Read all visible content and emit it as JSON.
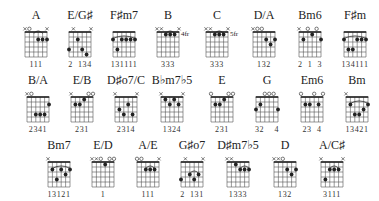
{
  "colors": {
    "ink": "#222222",
    "grid": "#555555",
    "background": "#ffffff"
  },
  "chords": [
    {
      "name": "A",
      "x": 14,
      "y": 8,
      "markers": [
        "x",
        "o",
        "",
        "",
        "",
        "x"
      ],
      "dots": [
        [
          3,
          2
        ],
        [
          4,
          2
        ],
        [
          5,
          2
        ]
      ],
      "barre": {
        "from": 2,
        "to": 4,
        "arc": true
      },
      "fret_label": "",
      "fingering": "111"
    },
    {
      "name": "E/G♯",
      "x": 58,
      "y": 8,
      "markers": [
        "",
        "x",
        "",
        "",
        "",
        "x"
      ],
      "dots": [
        [
          0,
          4
        ],
        [
          2,
          2
        ],
        [
          3,
          4
        ],
        [
          4,
          5
        ]
      ],
      "barre": null,
      "fret_label": "",
      "fingering": "2  134"
    },
    {
      "name": "F♯m7",
      "x": 102,
      "y": 8,
      "markers": [
        "",
        "",
        "",
        "",
        "",
        ""
      ],
      "dots": [
        [
          0,
          2
        ],
        [
          1,
          4
        ],
        [
          2,
          2
        ],
        [
          3,
          2
        ],
        [
          4,
          2
        ],
        [
          5,
          2
        ]
      ],
      "barre": {
        "from": 0,
        "to": 5,
        "arc": true
      },
      "fret_label": "",
      "fingering": "131111"
    },
    {
      "name": "B",
      "x": 146,
      "y": 8,
      "markers": [
        "x",
        "x",
        "",
        "",
        "",
        "x"
      ],
      "dots": [
        [
          2,
          1
        ],
        [
          3,
          1
        ],
        [
          4,
          1
        ]
      ],
      "barre": {
        "from": 2,
        "to": 4,
        "arc": true
      },
      "fret_label": "4fr",
      "fingering": "333"
    },
    {
      "name": "C",
      "x": 195,
      "y": 8,
      "markers": [
        "x",
        "x",
        "",
        "",
        "",
        "x"
      ],
      "dots": [
        [
          2,
          1
        ],
        [
          3,
          1
        ],
        [
          4,
          1
        ]
      ],
      "barre": {
        "from": 2,
        "to": 4,
        "arc": true
      },
      "fret_label": "5fr",
      "fingering": "333"
    },
    {
      "name": "D/A",
      "x": 242,
      "y": 8,
      "markers": [
        "x",
        "o",
        "o",
        "",
        "",
        ""
      ],
      "dots": [
        [
          3,
          2
        ],
        [
          4,
          3
        ],
        [
          5,
          2
        ]
      ],
      "barre": null,
      "fret_label": "",
      "fingering": "132"
    },
    {
      "name": "Bm6",
      "x": 288,
      "y": 8,
      "markers": [
        "x",
        "",
        "o",
        "",
        "o",
        ""
      ],
      "dots": [
        [
          1,
          2
        ],
        [
          3,
          1
        ],
        [
          5,
          2
        ]
      ],
      "barre": null,
      "fret_label": "",
      "fingering": "2  1  3"
    },
    {
      "name": "F♯m",
      "x": 333,
      "y": 8,
      "markers": [
        "",
        "",
        "",
        "",
        "",
        ""
      ],
      "dots": [
        [
          0,
          2
        ],
        [
          1,
          4
        ],
        [
          2,
          4
        ],
        [
          3,
          2
        ],
        [
          4,
          2
        ],
        [
          5,
          2
        ]
      ],
      "barre": {
        "from": 0,
        "to": 5,
        "arc": true
      },
      "fret_label": "",
      "fingering": "134111"
    },
    {
      "name": "B/A",
      "x": 16,
      "y": 73,
      "markers": [
        "x",
        "o",
        "",
        "",
        "",
        ""
      ],
      "dots": [
        [
          2,
          4
        ],
        [
          3,
          4
        ],
        [
          4,
          4
        ],
        [
          5,
          2
        ]
      ],
      "barre": null,
      "fret_label": "",
      "fingering": "2341"
    },
    {
      "name": "E/B",
      "x": 60,
      "y": 73,
      "markers": [
        "x",
        "",
        "",
        "",
        "o",
        "o"
      ],
      "dots": [
        [
          1,
          2
        ],
        [
          2,
          2
        ],
        [
          3,
          1
        ]
      ],
      "barre": null,
      "fret_label": "",
      "fingering": "231"
    },
    {
      "name": "D♯o7/C",
      "x": 104,
      "y": 73,
      "markers": [
        "x",
        "",
        "",
        "",
        "",
        "x"
      ],
      "dots": [
        [
          1,
          3
        ],
        [
          2,
          4
        ],
        [
          3,
          2
        ],
        [
          4,
          4
        ]
      ],
      "barre": null,
      "fret_label": "",
      "fingering": "2314"
    },
    {
      "name": "B♭m7♭5",
      "x": 150,
      "y": 73,
      "markers": [
        "x",
        "",
        "",
        "",
        "",
        "x"
      ],
      "dots": [
        [
          1,
          1
        ],
        [
          2,
          2
        ],
        [
          3,
          1
        ],
        [
          4,
          2
        ]
      ],
      "barre": null,
      "fret_label": "",
      "fingering": "1324"
    },
    {
      "name": "E",
      "x": 200,
      "y": 73,
      "markers": [
        "o",
        "",
        "",
        "",
        "o",
        "o"
      ],
      "dots": [
        [
          1,
          2
        ],
        [
          2,
          2
        ],
        [
          3,
          1
        ]
      ],
      "barre": null,
      "fret_label": "",
      "fingering": "231"
    },
    {
      "name": "G",
      "x": 245,
      "y": 73,
      "markers": [
        "",
        "",
        "o",
        "o",
        "o",
        ""
      ],
      "dots": [
        [
          0,
          3
        ],
        [
          1,
          2
        ],
        [
          5,
          3
        ]
      ],
      "barre": null,
      "fret_label": "",
      "fingering": "32    4"
    },
    {
      "name": "Em6",
      "x": 290,
      "y": 73,
      "markers": [
        "o",
        "",
        "",
        "o",
        "",
        "o"
      ],
      "dots": [
        [
          1,
          2
        ],
        [
          2,
          2
        ],
        [
          4,
          2
        ]
      ],
      "barre": null,
      "fret_label": "",
      "fingering": "23  4"
    },
    {
      "name": "Bm",
      "x": 335,
      "y": 73,
      "markers": [
        "x",
        "",
        "",
        "",
        "",
        ""
      ],
      "dots": [
        [
          1,
          2
        ],
        [
          2,
          4
        ],
        [
          3,
          4
        ],
        [
          4,
          3
        ],
        [
          5,
          2
        ]
      ],
      "barre": {
        "from": 1,
        "to": 5,
        "arc": true
      },
      "fret_label": "",
      "fingering": "13421"
    },
    {
      "name": "Bm7",
      "x": 37,
      "y": 138,
      "markers": [
        "x",
        "",
        "",
        "",
        "",
        ""
      ],
      "dots": [
        [
          1,
          2
        ],
        [
          2,
          4
        ],
        [
          3,
          2
        ],
        [
          4,
          3
        ],
        [
          5,
          2
        ]
      ],
      "barre": {
        "from": 1,
        "to": 5,
        "arc": true
      },
      "fret_label": "",
      "fingering": "13121"
    },
    {
      "name": "E/D",
      "x": 81,
      "y": 138,
      "markers": [
        "x",
        "x",
        "o",
        "",
        "o",
        "o"
      ],
      "dots": [
        [
          3,
          1
        ]
      ],
      "barre": null,
      "fret_label": "",
      "fingering": "1"
    },
    {
      "name": "A/E",
      "x": 126,
      "y": 138,
      "markers": [
        "o",
        "o",
        "",
        "",
        "",
        "x"
      ],
      "dots": [
        [
          2,
          2
        ],
        [
          3,
          2
        ],
        [
          4,
          2
        ]
      ],
      "barre": {
        "from": 2,
        "to": 4,
        "arc": true
      },
      "fret_label": "",
      "fingering": "111"
    },
    {
      "name": "G♯o7",
      "x": 170,
      "y": 138,
      "markers": [
        "",
        "x",
        "",
        "",
        "",
        "x"
      ],
      "dots": [
        [
          0,
          4
        ],
        [
          2,
          3
        ],
        [
          3,
          4
        ],
        [
          4,
          3
        ]
      ],
      "barre": {
        "from": 2,
        "to": 4,
        "arc": true
      },
      "fret_label": "",
      "fingering": "2  131"
    },
    {
      "name": "D♯m7♭5",
      "x": 216,
      "y": 138,
      "markers": [
        "x",
        "x",
        "",
        "",
        "",
        ""
      ],
      "dots": [
        [
          2,
          1
        ],
        [
          3,
          2
        ],
        [
          4,
          2
        ],
        [
          5,
          2
        ]
      ],
      "barre": {
        "from": 3,
        "to": 5,
        "arc": true
      },
      "fret_label": "",
      "fingering": "1333"
    },
    {
      "name": "D",
      "x": 263,
      "y": 138,
      "markers": [
        "x",
        "x",
        "o",
        "",
        "",
        ""
      ],
      "dots": [
        [
          3,
          2
        ],
        [
          4,
          3
        ],
        [
          5,
          2
        ]
      ],
      "barre": null,
      "fret_label": "",
      "fingering": "132"
    },
    {
      "name": "A/C♯",
      "x": 310,
      "y": 138,
      "markers": [
        "x",
        "",
        "",
        "",
        "",
        "x"
      ],
      "dots": [
        [
          1,
          4
        ],
        [
          2,
          2
        ],
        [
          3,
          2
        ],
        [
          4,
          2
        ]
      ],
      "barre": {
        "from": 2,
        "to": 4,
        "arc": true
      },
      "fret_label": "",
      "fingering": "3111"
    }
  ]
}
